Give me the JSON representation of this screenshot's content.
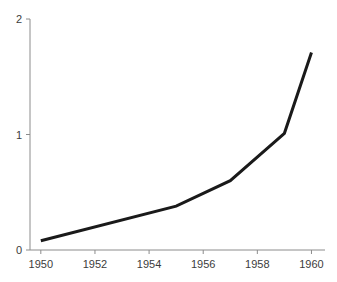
{
  "chart_data": {
    "type": "line",
    "title": "",
    "subtitle": "",
    "xlabel": "",
    "ylabel": "",
    "x": [
      1950,
      1955,
      1957,
      1959,
      1960
    ],
    "values": [
      0.08,
      0.38,
      0.6,
      1.01,
      1.71
    ],
    "series": [
      {
        "name": "series-1",
        "x": [
          1950,
          1955,
          1957,
          1959,
          1960
        ],
        "values": [
          0.08,
          0.38,
          0.6,
          1.01,
          1.71
        ],
        "color": "#1a1a1a",
        "line_width": 3
      }
    ],
    "xlim": [
      1949.6,
      1960.5
    ],
    "ylim": [
      0,
      2
    ],
    "xticks": [
      1950,
      1952,
      1954,
      1956,
      1958,
      1960
    ],
    "xticklabels": [
      "1950",
      "1952",
      "1954",
      "1956",
      "1958",
      "1960"
    ],
    "yticks": [
      0,
      1,
      2
    ],
    "yticklabels": [
      "0",
      "1",
      "2"
    ],
    "grid": false,
    "legend": null,
    "legend_position": "none",
    "annotations": [],
    "markers": false,
    "background_color": "#ffffff",
    "axis_color": "#8c8c8c",
    "tick_label_color": "#3c3c3c"
  },
  "axes": {
    "y_axis_name": "y-axis",
    "x_axis_name": "x-axis"
  }
}
